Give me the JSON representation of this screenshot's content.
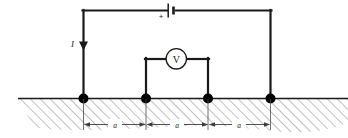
{
  "figure": {
    "labels": {
      "current": "I",
      "battery_polarity": "+",
      "voltmeter": "V",
      "spacing_1": "a",
      "spacing_2": "a",
      "spacing_3": "a"
    },
    "colors": {
      "line": "#1a1a1a",
      "electrode": "#000000",
      "hatch": "#7a7a7a",
      "background": "#ffffff",
      "dimension": "#555555"
    },
    "components": [
      {
        "name": "battery",
        "symbol": "+|-",
        "position": "top-wire-center"
      },
      {
        "name": "voltmeter",
        "symbol": "V",
        "position": "inner-loop-center"
      },
      {
        "name": "current-arrow",
        "symbol": "down-arrow",
        "position": "left-wire"
      },
      {
        "name": "electrode",
        "count": 4,
        "position": "ground-surface"
      },
      {
        "name": "ground-hatching",
        "position": "below-surface"
      }
    ],
    "dimensions": {
      "electrode_spacing_label": "a",
      "segments": 3
    }
  }
}
